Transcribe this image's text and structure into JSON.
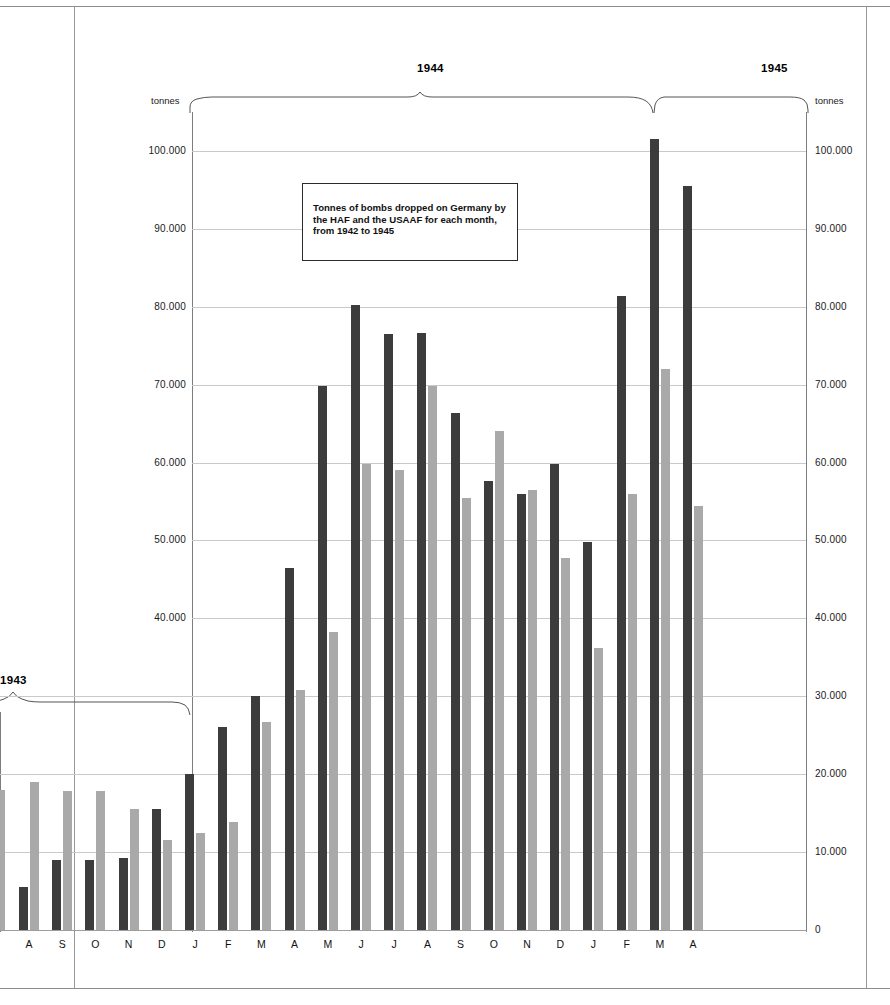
{
  "caption": {
    "text": "Tonnes of bombs dropped on Germany by the HAF and the USAAF for each month, from 1942 to 1945"
  },
  "axis": {
    "unit_left": "tonnes",
    "unit_right": "tonnes",
    "ticks": [
      "100.000",
      "90.000",
      "80.000",
      "70.000",
      "60.000",
      "50.000",
      "40.000",
      "30.000",
      "20.000",
      "10.000",
      "0"
    ],
    "tick_values": [
      100000,
      90000,
      80000,
      70000,
      60000,
      50000,
      40000,
      30000,
      20000,
      10000,
      0
    ]
  },
  "year_brackets": [
    {
      "label": "1943"
    },
    {
      "label": "1944"
    },
    {
      "label": "1945"
    }
  ],
  "chart_data": {
    "type": "bar",
    "title": "Tonnes of bombs dropped on Germany by the HAF and the USAAF for each month, from 1942 to 1945",
    "xlabel": "",
    "ylabel": "tonnes",
    "ylim": [
      0,
      105000
    ],
    "ytick_step": 10000,
    "grid": true,
    "legend_position": "none",
    "colors": {
      "raf": "#3c3c3c",
      "usaaf": "#a9a9a9",
      "gridline": "#c9c9c9",
      "axis": "#7d7d7d",
      "background": "#ffffff"
    },
    "categories": [
      "A",
      "S",
      "O",
      "N",
      "D",
      "J",
      "F",
      "M",
      "A",
      "M",
      "J",
      "J",
      "A",
      "S",
      "O",
      "N",
      "D",
      "J",
      "F",
      "M",
      "A"
    ],
    "category_years": [
      "1943",
      "1943",
      "1943",
      "1943",
      "1943",
      "1944",
      "1944",
      "1944",
      "1944",
      "1944",
      "1944",
      "1944",
      "1944",
      "1944",
      "1944",
      "1944",
      "1944",
      "1945",
      "1945",
      "1945",
      "1945"
    ],
    "series": [
      {
        "name": "RAF",
        "color": "#3c3c3c",
        "values": [
          5500,
          9000,
          9000,
          9300,
          15500,
          20000,
          26000,
          30000,
          46500,
          69800,
          80200,
          76500,
          76600,
          66400,
          57700,
          56000,
          59800,
          49800,
          81400,
          101500,
          95500
        ]
      },
      {
        "name": "USAAF",
        "color": "#a9a9a9",
        "values": [
          19000,
          17800,
          17900,
          15500,
          11500,
          12500,
          13900,
          26700,
          30800,
          38200,
          59800,
          59100,
          69800,
          55500,
          64000,
          56500,
          47800,
          36200,
          56000,
          72000,
          54400
        ]
      }
    ],
    "partial_left_bar": {
      "series": "USAAF",
      "value": 18000
    }
  }
}
